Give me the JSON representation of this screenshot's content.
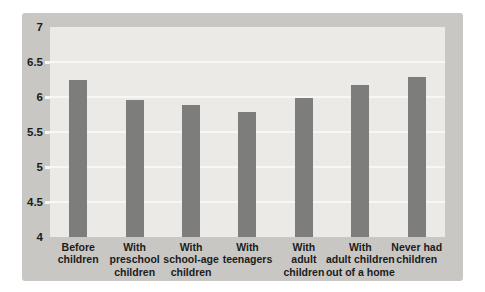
{
  "chart_data": {
    "type": "bar",
    "title": "",
    "xlabel": "",
    "ylabel": "",
    "categories": [
      "Before children",
      "With preschool children",
      "With school-age children",
      "With teenagers",
      "With adult children",
      "With adult children out of a home",
      "Never had children"
    ],
    "category_lines": [
      [
        "Before",
        "children"
      ],
      [
        "With",
        "preschool",
        "children"
      ],
      [
        "With",
        "school-age",
        "children"
      ],
      [
        "With",
        "teenagers"
      ],
      [
        "With",
        "adult",
        "children"
      ],
      [
        "With",
        "adult children",
        "out of a home"
      ],
      [
        "Never had",
        "children"
      ]
    ],
    "values": [
      6.24,
      5.96,
      5.89,
      5.79,
      5.98,
      6.17,
      6.28
    ],
    "ylim": [
      4,
      7
    ],
    "yticks": [
      7,
      6.5,
      6,
      5.5,
      5,
      4.5,
      4
    ],
    "grid": true,
    "legend": false,
    "colors": {
      "page_bg": "#ffffff",
      "panel_bg": "#c8c7c3",
      "plot_bg": "#eceae6",
      "bar": "#7d7d7b",
      "gridline": "#f8f7f4",
      "text": "#1c1c1c"
    }
  }
}
